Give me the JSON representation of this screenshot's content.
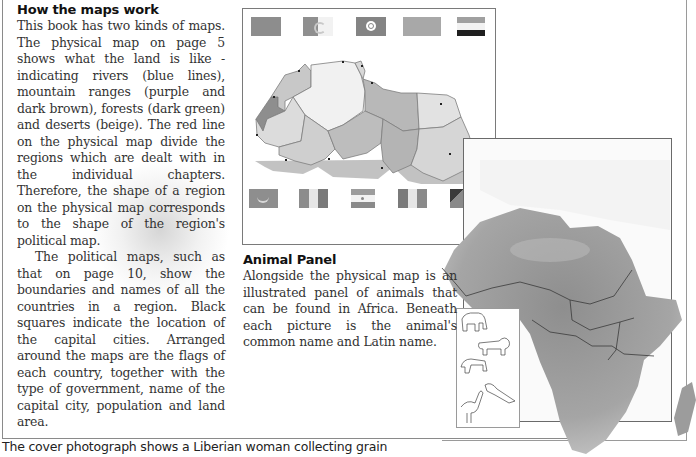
{
  "page": {
    "section_how_maps_work": {
      "heading": "How the maps work",
      "paragraph_1": "This book has two kinds of maps. The physical map on page 5 shows what the land is like - indicating rivers (blue lines), mountain ranges (purple and dark brown), forests (dark green) and deserts (beige). The red line on the physical map divide the regions which are dealt with in the individual chapters. Therefore, the shape of a region on the physical map corresponds to the shape of the region's political map.",
      "paragraph_2": "The political maps, such as that on page 10, show the boundaries and names of all the countries in a region. Black squares indicate the location of the capital cities. Arranged around the maps are the flags of each country, together with the type of government, name of the capital city, population and land area."
    },
    "section_animal_panel": {
      "heading": "Animal Panel",
      "paragraph": "Alongside the physical map is an illustrated panel of animals that can be found in Africa. Beneath each picture is the animal's common name and Latin name."
    },
    "caption": "The cover photograph shows a Liberian woman collecting grain"
  },
  "political_map": {
    "region": "North Africa",
    "flags_top": [
      "morocco-flag",
      "algeria-flag",
      "tunisia-flag",
      "libya-flag",
      "egypt-flag"
    ],
    "flags_bottom": [
      "mauritania-flag",
      "mali-flag",
      "niger-flag",
      "chad-flag",
      "sudan-flag"
    ]
  },
  "physical_map": {
    "region": "Africa",
    "animal_panel_items": [
      "elephant",
      "lion",
      "wildebeest",
      "crocodile",
      "ostrich"
    ]
  },
  "colors": {
    "text": "#333333",
    "heading": "#111111",
    "frame": "#8a8a8a",
    "map_gray": "#9e9e9e"
  }
}
